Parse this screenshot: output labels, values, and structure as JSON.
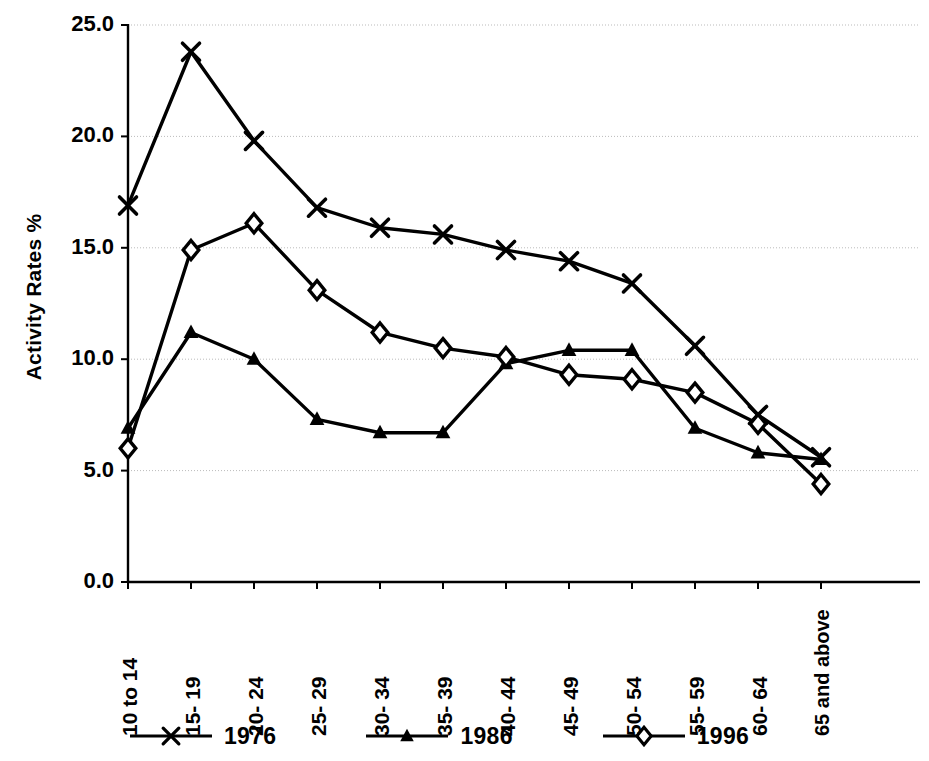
{
  "chart_data": {
    "type": "line",
    "title": "",
    "subtitle": "",
    "xlabel": "",
    "ylabel": "Activity Rates %",
    "categories": [
      "10 to 14",
      "15- 19",
      "20- 24",
      "25- 29",
      "30- 34",
      "35- 39",
      "40- 44",
      "45- 49",
      "50- 54",
      "55- 59",
      "60- 64",
      "65 and above"
    ],
    "ylim": [
      0.0,
      25.0
    ],
    "ytick_values": [
      0.0,
      5.0,
      10.0,
      15.0,
      20.0,
      25.0
    ],
    "ytick_labels": [
      "0.0",
      "5.0",
      "10.0",
      "15.0",
      "20.0",
      "25.0"
    ],
    "grid": "horizontal",
    "legend_position": "bottom",
    "series": [
      {
        "name": "1976",
        "marker": "x-cross",
        "color": "#000000",
        "values": [
          16.9,
          23.8,
          19.8,
          16.8,
          15.9,
          15.6,
          14.9,
          14.4,
          13.4,
          10.6,
          7.5,
          5.6
        ]
      },
      {
        "name": "1986",
        "marker": "triangle",
        "color": "#000000",
        "values": [
          6.9,
          11.2,
          10.0,
          7.3,
          6.7,
          6.7,
          9.8,
          10.4,
          10.4,
          6.9,
          5.8,
          5.5
        ]
      },
      {
        "name": "1996",
        "marker": "diamond",
        "color": "#000000",
        "values": [
          6.0,
          14.9,
          16.1,
          13.1,
          11.2,
          10.5,
          10.1,
          9.3,
          9.1,
          8.5,
          7.1,
          4.4
        ]
      }
    ]
  },
  "legend": {
    "items": [
      {
        "label": "1976",
        "marker": "x-cross"
      },
      {
        "label": "1986",
        "marker": "triangle"
      },
      {
        "label": "1996",
        "marker": "diamond"
      }
    ]
  }
}
